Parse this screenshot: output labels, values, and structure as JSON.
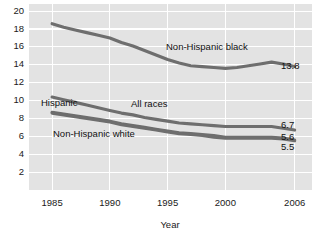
{
  "chart_data": {
    "type": "line",
    "title": "",
    "xlabel": "Year",
    "ylabel": "",
    "xlim": [
      1983,
      2007.5
    ],
    "ylim": [
      0,
      20.8
    ],
    "grid": true,
    "legend_position": "inline-annotations",
    "xticks": [
      "1985",
      "1990",
      "1995",
      "2000",
      "2006"
    ],
    "xtick_values": [
      1985,
      1990,
      1995,
      2000,
      2006
    ],
    "yticks": [
      "2",
      "4",
      "6",
      "8",
      "10",
      "12",
      "14",
      "16",
      "18",
      "20"
    ],
    "ytick_values": [
      2,
      4,
      6,
      8,
      10,
      12,
      14,
      16,
      18,
      20
    ],
    "series": [
      {
        "name": "Non-Hispanic black",
        "label": "Non-Hispanic black",
        "end_value": "13.8",
        "color": "#6e6e6e",
        "x": [
          1985,
          1986,
          1987,
          1988,
          1989,
          1990,
          1991,
          1992,
          1993,
          1994,
          1995,
          1996,
          1997,
          1998,
          1999,
          2000,
          2001,
          2002,
          2003,
          2004,
          2005,
          2006
        ],
        "values": [
          18.6,
          18.2,
          17.9,
          17.6,
          17.3,
          17.0,
          16.5,
          16.1,
          15.6,
          15.1,
          14.6,
          14.2,
          13.9,
          13.8,
          13.7,
          13.6,
          13.7,
          13.9,
          14.1,
          14.3,
          14.1,
          13.8
        ]
      },
      {
        "name": "Hispanic",
        "label": "Hispanic",
        "end_value": "6.7",
        "color": "#6e6e6e",
        "x": [
          1985,
          1986,
          1987,
          1988,
          1989,
          1990,
          1991,
          1992,
          1993,
          1994,
          1995,
          1996,
          1997,
          1998,
          1999,
          2000,
          2001,
          2002,
          2003,
          2004,
          2005,
          2006
        ],
        "values": [
          10.4,
          10.1,
          9.8,
          9.5,
          9.2,
          8.9,
          8.6,
          8.4,
          8.1,
          7.9,
          7.7,
          7.5,
          7.4,
          7.3,
          7.2,
          7.1,
          7.1,
          7.1,
          7.1,
          7.1,
          6.9,
          6.7
        ]
      },
      {
        "name": "All races",
        "label": "All races",
        "end_value": "5.6",
        "color": "#6e6e6e",
        "x": [
          1985,
          1986,
          1987,
          1988,
          1989,
          1990,
          1991,
          1992,
          1993,
          1994,
          1995,
          1996,
          1997,
          1998,
          1999,
          2000,
          2001,
          2002,
          2003,
          2004,
          2005,
          2006
        ],
        "values": [
          8.7,
          8.5,
          8.3,
          8.1,
          7.9,
          7.7,
          7.4,
          7.2,
          7.0,
          6.8,
          6.6,
          6.4,
          6.3,
          6.2,
          6.1,
          5.9,
          5.9,
          5.9,
          5.9,
          5.9,
          5.8,
          5.6
        ]
      },
      {
        "name": "Non-Hispanic white",
        "label": "Non-Hispanic white",
        "end_value": "5.5",
        "color": "#8a8a8a",
        "x": [
          1985,
          1986,
          1987,
          1988,
          1989,
          1990,
          1991,
          1992,
          1993,
          1994,
          1995,
          1996,
          1997,
          1998,
          1999,
          2000,
          2001,
          2002,
          2003,
          2004,
          2005,
          2006
        ],
        "values": [
          8.6,
          8.4,
          8.2,
          8.0,
          7.8,
          7.6,
          7.3,
          7.1,
          6.9,
          6.7,
          6.5,
          6.3,
          6.2,
          6.1,
          5.9,
          5.8,
          5.8,
          5.8,
          5.8,
          5.8,
          5.7,
          5.5
        ]
      }
    ],
    "annotations": [
      {
        "text": "Non-Hispanic black",
        "x_px": 166,
        "y_px": 50
      },
      {
        "text": "Hispanic",
        "x_px": 41,
        "y_px": 106
      },
      {
        "text": "All races",
        "x_px": 131,
        "y_px": 107
      },
      {
        "text": "Non-Hispanic white",
        "x_px": 53,
        "y_px": 137
      }
    ],
    "end_labels": [
      {
        "text": "13.8",
        "x_px": 281,
        "y_px": 69
      },
      {
        "text": "6.7",
        "x_px": 281,
        "y_px": 128
      },
      {
        "text": "5.6",
        "x_px": 281,
        "y_px": 140
      },
      {
        "text": "5.5",
        "x_px": 281,
        "y_px": 150
      }
    ]
  }
}
